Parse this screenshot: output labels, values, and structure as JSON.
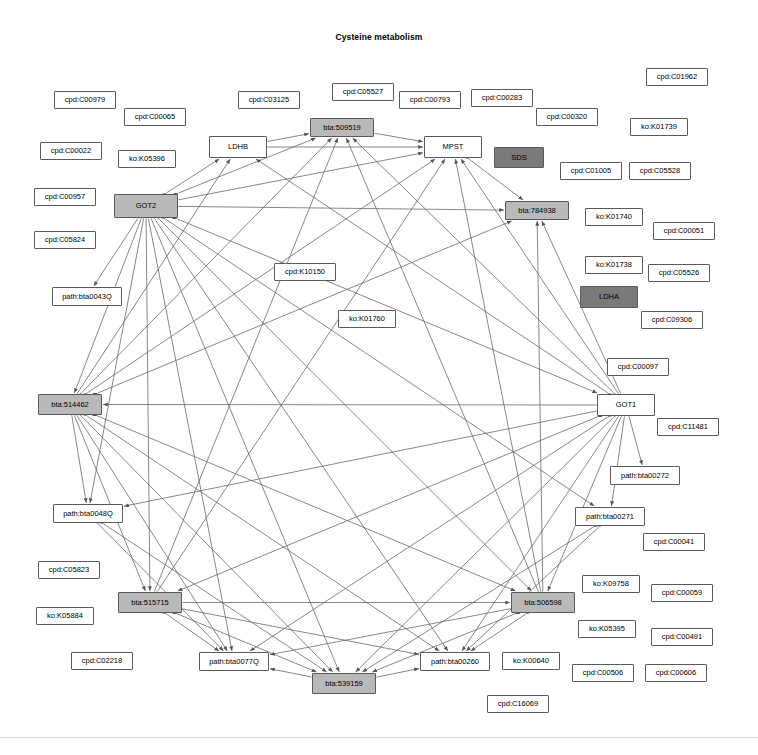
{
  "title": "Cysteine metabolism",
  "graph": {
    "type": "network-diagram",
    "legend_note": "",
    "nodes": [
      {
        "id": "n1",
        "label": "cpd:C01962",
        "x": 646,
        "y": 68,
        "w": 62,
        "h": 18,
        "style": "white"
      },
      {
        "id": "n2",
        "label": "cpd:C05527",
        "x": 332,
        "y": 83,
        "w": 62,
        "h": 18,
        "style": "white"
      },
      {
        "id": "n3",
        "label": "cpd:C00979",
        "x": 54,
        "y": 91,
        "w": 62,
        "h": 18,
        "style": "white"
      },
      {
        "id": "n4",
        "label": "cpd:C03125",
        "x": 238,
        "y": 91,
        "w": 62,
        "h": 18,
        "style": "white"
      },
      {
        "id": "n5",
        "label": "cpd:C00793",
        "x": 399,
        "y": 91,
        "w": 62,
        "h": 18,
        "style": "white"
      },
      {
        "id": "n6",
        "label": "cpd:C00283",
        "x": 471,
        "y": 89,
        "w": 62,
        "h": 18,
        "style": "white"
      },
      {
        "id": "n7",
        "label": "cpd:C00065",
        "x": 124,
        "y": 108,
        "w": 62,
        "h": 18,
        "style": "white"
      },
      {
        "id": "n8",
        "label": "cpd:C00320",
        "x": 536,
        "y": 108,
        "w": 62,
        "h": 18,
        "style": "white"
      },
      {
        "id": "n9",
        "label": "ko:K01739",
        "x": 630,
        "y": 118,
        "w": 58,
        "h": 18,
        "style": "white"
      },
      {
        "id": "n10",
        "label": "bta:509519",
        "x": 310,
        "y": 118,
        "w": 64,
        "h": 19,
        "style": "grey"
      },
      {
        "id": "n11",
        "label": "LDHB",
        "x": 209,
        "y": 136,
        "w": 58,
        "h": 22,
        "style": "white"
      },
      {
        "id": "n12",
        "label": "MPST",
        "x": 424,
        "y": 136,
        "w": 58,
        "h": 22,
        "style": "white"
      },
      {
        "id": "n13",
        "label": "cpd:C00022",
        "x": 40,
        "y": 142,
        "w": 62,
        "h": 18,
        "style": "white"
      },
      {
        "id": "n14",
        "label": "ko:K05396",
        "x": 118,
        "y": 150,
        "w": 58,
        "h": 18,
        "style": "white"
      },
      {
        "id": "n15",
        "label": "SDS",
        "x": 494,
        "y": 147,
        "w": 50,
        "h": 21,
        "style": "dark"
      },
      {
        "id": "n16",
        "label": "cpd:C01005",
        "x": 560,
        "y": 162,
        "w": 62,
        "h": 18,
        "style": "white"
      },
      {
        "id": "n17",
        "label": "cpd:C05528",
        "x": 629,
        "y": 162,
        "w": 62,
        "h": 18,
        "style": "white"
      },
      {
        "id": "n18",
        "label": "cpd:C00957",
        "x": 34,
        "y": 188,
        "w": 62,
        "h": 18,
        "style": "white"
      },
      {
        "id": "n19",
        "label": "GOT2",
        "x": 114,
        "y": 194,
        "w": 64,
        "h": 24,
        "style": "grey"
      },
      {
        "id": "n20",
        "label": "bta:784938",
        "x": 505,
        "y": 201,
        "w": 64,
        "h": 19,
        "style": "grey"
      },
      {
        "id": "n21",
        "label": "ko:K01740",
        "x": 585,
        "y": 208,
        "w": 58,
        "h": 18,
        "style": "white"
      },
      {
        "id": "n22",
        "label": "cpd:C00051",
        "x": 653,
        "y": 222,
        "w": 62,
        "h": 18,
        "style": "white"
      },
      {
        "id": "n23",
        "label": "cpd:C05824",
        "x": 34,
        "y": 231,
        "w": 62,
        "h": 18,
        "style": "white"
      },
      {
        "id": "n24",
        "label": "ko:K01738",
        "x": 585,
        "y": 256,
        "w": 58,
        "h": 18,
        "style": "white"
      },
      {
        "id": "n25",
        "label": "cpd:C05526",
        "x": 648,
        "y": 264,
        "w": 62,
        "h": 18,
        "style": "white"
      },
      {
        "id": "n26",
        "label": "cpd:K10150",
        "x": 274,
        "y": 263,
        "w": 62,
        "h": 18,
        "style": "white"
      },
      {
        "id": "n27",
        "label": "LDHA",
        "x": 580,
        "y": 286,
        "w": 58,
        "h": 22,
        "style": "dark"
      },
      {
        "id": "n28",
        "label": "path:bta0043Q",
        "x": 52,
        "y": 287,
        "w": 70,
        "h": 19,
        "style": "white"
      },
      {
        "id": "n29",
        "label": "cpd:C09306",
        "x": 641,
        "y": 311,
        "w": 62,
        "h": 18,
        "style": "white"
      },
      {
        "id": "n30",
        "label": "ko:K01760",
        "x": 338,
        "y": 310,
        "w": 58,
        "h": 18,
        "style": "white"
      },
      {
        "id": "n31",
        "label": "cpd:C00097",
        "x": 607,
        "y": 358,
        "w": 62,
        "h": 18,
        "style": "white"
      },
      {
        "id": "n32",
        "label": "GOT1",
        "x": 597,
        "y": 394,
        "w": 58,
        "h": 22,
        "style": "white"
      },
      {
        "id": "n33",
        "label": "bta:514462",
        "x": 38,
        "y": 394,
        "w": 64,
        "h": 21,
        "style": "grey"
      },
      {
        "id": "n34",
        "label": "cpd:C11481",
        "x": 657,
        "y": 418,
        "w": 62,
        "h": 18,
        "style": "white"
      },
      {
        "id": "n35",
        "label": "path:bta00272",
        "x": 610,
        "y": 466,
        "w": 70,
        "h": 19,
        "style": "white"
      },
      {
        "id": "n36",
        "label": "path:bta0048Q",
        "x": 53,
        "y": 504,
        "w": 70,
        "h": 19,
        "style": "white"
      },
      {
        "id": "n37",
        "label": "path:bta00271",
        "x": 575,
        "y": 507,
        "w": 70,
        "h": 19,
        "style": "white"
      },
      {
        "id": "n38",
        "label": "cpd:C00041",
        "x": 643,
        "y": 533,
        "w": 62,
        "h": 18,
        "style": "white"
      },
      {
        "id": "n39",
        "label": "cpd:C05823",
        "x": 38,
        "y": 561,
        "w": 62,
        "h": 18,
        "style": "white"
      },
      {
        "id": "n40",
        "label": "ko:K09758",
        "x": 582,
        "y": 575,
        "w": 58,
        "h": 18,
        "style": "white"
      },
      {
        "id": "n41",
        "label": "bta:515715",
        "x": 118,
        "y": 592,
        "w": 64,
        "h": 21,
        "style": "grey"
      },
      {
        "id": "n42",
        "label": "bta:506598",
        "x": 511,
        "y": 592,
        "w": 64,
        "h": 21,
        "style": "grey"
      },
      {
        "id": "n43",
        "label": "cpd:C00059",
        "x": 651,
        "y": 584,
        "w": 62,
        "h": 18,
        "style": "white"
      },
      {
        "id": "n44",
        "label": "ko:K05884",
        "x": 36,
        "y": 607,
        "w": 58,
        "h": 18,
        "style": "white"
      },
      {
        "id": "n45",
        "label": "ko:K05395",
        "x": 578,
        "y": 620,
        "w": 58,
        "h": 18,
        "style": "white"
      },
      {
        "id": "n46",
        "label": "cpd:C00491",
        "x": 651,
        "y": 628,
        "w": 62,
        "h": 18,
        "style": "white"
      },
      {
        "id": "n47",
        "label": "cpd:C02218",
        "x": 71,
        "y": 652,
        "w": 62,
        "h": 18,
        "style": "white"
      },
      {
        "id": "n48",
        "label": "path:bta0077Q",
        "x": 199,
        "y": 652,
        "w": 70,
        "h": 19,
        "style": "white"
      },
      {
        "id": "n49",
        "label": "path:bta00260",
        "x": 420,
        "y": 652,
        "w": 70,
        "h": 19,
        "style": "white"
      },
      {
        "id": "n50",
        "label": "ko:K00640",
        "x": 502,
        "y": 652,
        "w": 58,
        "h": 18,
        "style": "white"
      },
      {
        "id": "n51",
        "label": "cpd:C00506",
        "x": 572,
        "y": 664,
        "w": 62,
        "h": 18,
        "style": "white"
      },
      {
        "id": "n52",
        "label": "cpd:C00606",
        "x": 645,
        "y": 664,
        "w": 62,
        "h": 18,
        "style": "white"
      },
      {
        "id": "n53",
        "label": "bta:539159",
        "x": 312,
        "y": 673,
        "w": 64,
        "h": 21,
        "style": "grey"
      },
      {
        "id": "n54",
        "label": "cpd:C16069",
        "x": 487,
        "y": 695,
        "w": 62,
        "h": 18,
        "style": "white"
      }
    ],
    "hub_nodes": [
      "GOT2",
      "GOT1",
      "bta:514462",
      "bta:515715",
      "bta:506598",
      "bta:539159",
      "MPST",
      "LDHB",
      "bta:509519",
      "bta:784938",
      "path:bta00770",
      "path:bta00260"
    ],
    "edges": [
      [
        "n19",
        "n11"
      ],
      [
        "n19",
        "n10"
      ],
      [
        "n19",
        "n12"
      ],
      [
        "n19",
        "n20"
      ],
      [
        "n19",
        "n32"
      ],
      [
        "n19",
        "n28"
      ],
      [
        "n19",
        "n33"
      ],
      [
        "n19",
        "n36"
      ],
      [
        "n19",
        "n41"
      ],
      [
        "n19",
        "n48"
      ],
      [
        "n19",
        "n53"
      ],
      [
        "n19",
        "n49"
      ],
      [
        "n19",
        "n42"
      ],
      [
        "n19",
        "n37"
      ],
      [
        "n32",
        "n11"
      ],
      [
        "n32",
        "n10"
      ],
      [
        "n32",
        "n12"
      ],
      [
        "n32",
        "n20"
      ],
      [
        "n32",
        "n33"
      ],
      [
        "n32",
        "n35"
      ],
      [
        "n32",
        "n37"
      ],
      [
        "n32",
        "n42"
      ],
      [
        "n32",
        "n49"
      ],
      [
        "n32",
        "n53"
      ],
      [
        "n32",
        "n48"
      ],
      [
        "n32",
        "n41"
      ],
      [
        "n32",
        "n36"
      ],
      [
        "n33",
        "n11"
      ],
      [
        "n33",
        "n10"
      ],
      [
        "n33",
        "n12"
      ],
      [
        "n33",
        "n20"
      ],
      [
        "n33",
        "n36"
      ],
      [
        "n33",
        "n41"
      ],
      [
        "n33",
        "n48"
      ],
      [
        "n33",
        "n53"
      ],
      [
        "n33",
        "n49"
      ],
      [
        "n33",
        "n42"
      ],
      [
        "n41",
        "n48"
      ],
      [
        "n41",
        "n53"
      ],
      [
        "n41",
        "n49"
      ],
      [
        "n41",
        "n42"
      ],
      [
        "n41",
        "n10"
      ],
      [
        "n41",
        "n12"
      ],
      [
        "n42",
        "n48"
      ],
      [
        "n42",
        "n53"
      ],
      [
        "n42",
        "n49"
      ],
      [
        "n42",
        "n10"
      ],
      [
        "n42",
        "n12"
      ],
      [
        "n42",
        "n20"
      ],
      [
        "n53",
        "n48"
      ],
      [
        "n53",
        "n49"
      ],
      [
        "n11",
        "n10"
      ],
      [
        "n10",
        "n12"
      ],
      [
        "n12",
        "n20"
      ],
      [
        "n11",
        "n12"
      ],
      [
        "n36",
        "n48"
      ],
      [
        "n36",
        "n53"
      ],
      [
        "n37",
        "n49"
      ],
      [
        "n37",
        "n53"
      ]
    ]
  }
}
